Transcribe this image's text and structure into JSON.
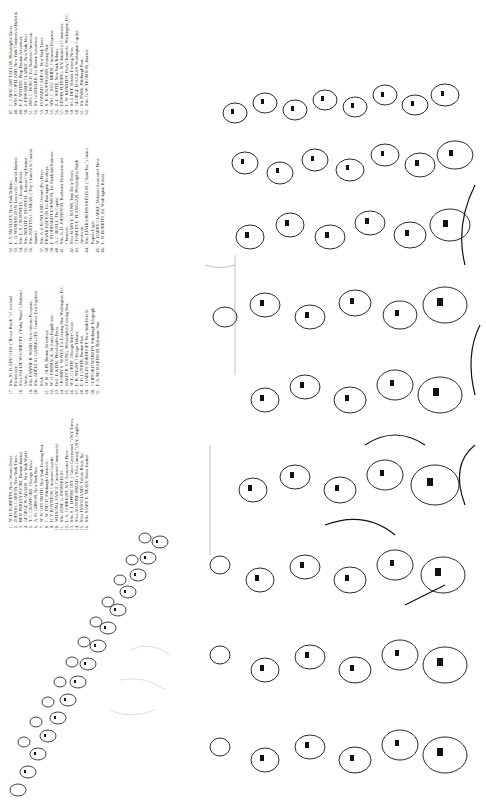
{
  "page": {
    "orientation": "rotated-90-ccw"
  },
  "key": {
    "bands": [
      {
        "range": "47-62",
        "entries": [
          {
            "n": "47.",
            "text": "C. CATHCART TAYLOR, Philadelphia Times."
          },
          {
            "n": "48.",
            "text": "WM. P. COPELAND, New York Commercial Bulletin."
          },
          {
            "n": "49.",
            "text": "E. F. WATERS, Prop. Boston Advertiser."
          },
          {
            "n": "50.",
            "text": "J. EDWARDS CLARKE, New York Mail."
          },
          {
            "n": "51.",
            "text": "JNO. C. BURCH, Ed. Nashville American."
          },
          {
            "n": "52.",
            "text": "Mr. GODDARD, Ed. Boston Advertiser."
          },
          {
            "n": "53.",
            "text": "HOWARD CARROL, New York Times."
          },
          {
            "n": "54.",
            "text": "S. H. KAUFFMANN, Evening Star."
          },
          {
            "n": "55.",
            "text": "WM. C. MAC BRIDE, Cincinnati Enquirer."
          },
          {
            "n": "56.",
            "text": "Z. L. WHITE, New York Tribune."
          },
          {
            "n": "57.",
            "text": "EDWIN FLEMING, N.Y. Journal of Commerce."
          },
          {
            "n": "58.",
            "text": "L. W. KENNEDY, Daily Chronicle, Washington, D.C."
          },
          {
            "n": "59.",
            "text": "M. J. DEE, Detroit Evening News."
          },
          {
            "n": "60.",
            "text": "GEORGE DOUGLAS, Washington Capital."
          },
          {
            "n": "61.",
            "text": "Mr. PARK, Pittsburgh Post."
          },
          {
            "n": "62.",
            "text": "Mrs. G. W. THOMSON, Journal."
          }
        ]
      },
      {
        "range": "32-46",
        "entries": [
          {
            "n": "32.",
            "text": "E. V. SMALLEY, New York Tribune."
          },
          {
            "n": "33.",
            "text": "L. Q. WASHINGTON, Louisville Courier Journal."
          },
          {
            "n": "34.",
            "text": "Mrs. E. S. CROMWELL, Chicago Herald."
          },
          {
            "n": "35.",
            "text": "Mrs. NELLIE S. STOWELL, Kansas City Journal."
          },
          {
            "n": "36.",
            "text": "Mrs. JAYETTA C. SNEAD, (\"Fay\") Louisville Courier Journal."
          },
          {
            "n": "37.",
            "text": "Mrs. A. J. ROWLAND, Oxford (Pa.) Press."
          },
          {
            "n": "38.",
            "text": "FRANK HATTON, Ed. Burlington Hawkeye."
          },
          {
            "n": "39.",
            "text": "E. STODDARDT JOHNSON, Ed. Frankfort Yeoman."
          },
          {
            "n": "40.",
            "text": "A. C. BUELL, The Capital."
          },
          {
            "n": "41.",
            "text": "Mrs. A. D. JOHNSTON, Rochester Democrat and Chronicle."
          },
          {
            "n": "42.",
            "text": "Miss MARY E. MANN, Troy Daily Times."
          },
          {
            "n": "43.",
            "text": "CHARLES L. FLANAGAN, Philadelphia North American."
          },
          {
            "n": "44.",
            "text": "Mrs. ELVIRA BLISS SHELDON, (\"Aunt Tue,\") Grand Rapids Eagle."
          },
          {
            "n": "45.",
            "text": "W. HARRY CLARKE, National Associated Press."
          },
          {
            "n": "46.",
            "text": "L. N. BURRITT, Ed. Washington Herald."
          }
        ]
      },
      {
        "range": "17-31",
        "entries": [
          {
            "n": "17.",
            "text": "Mrs. M. D. LINCOLN, (\"Bessie Beech,\") Cleveland Plaindealer."
          },
          {
            "n": "18.",
            "text": "Miss SALLIE WOODBURY, (\"Ruby Wood,\") National Union."
          },
          {
            "n": "19.",
            "text": "Mrs. FANNIE B. WARD, New Orleans Picayune."
          },
          {
            "n": "20.",
            "text": "Mrs. ADÈLE M. GARRIGUES, Courier, East Saginaw, Mich."
          },
          {
            "n": "21.",
            "text": "W. M. OLIN, Boston Advertiser."
          },
          {
            "n": "22.",
            "text": "W. O. FISHBACK, St. Louis Republican."
          },
          {
            "n": "23.",
            "text": "Dell. E. KEIM, Philadelphia Press."
          },
          {
            "n": "24.",
            "text": "CROSBY S. NOYES, Ed. Evening Star, Washington, D.C."
          },
          {
            "n": "25.",
            "text": "JAMES R. YOUNG, Philadelphia Evening Star."
          },
          {
            "n": "26.",
            "text": "W. E. CURTIS, Chicago Inter-Ocean."
          },
          {
            "n": "27.",
            "text": "E. B. WIGHT, Chicago Tribune."
          },
          {
            "n": "28.",
            "text": "E. H. LUTHER, Boston Post."
          },
          {
            "n": "29.",
            "text": "CHARLES NORDHOFF, New York Herald."
          },
          {
            "n": "30.",
            "text": "CLIFFORD WARDEN, Pittsburgh Telegraph."
          },
          {
            "n": "31.",
            "text": "F. A. RICHARDSON, Baltimore Sun."
          }
        ]
      },
      {
        "range": "1-16",
        "entries": [
          {
            "n": "1.",
            "text": "W. H. ROBERTS, New Orleans Times."
          },
          {
            "n": "2.",
            "text": "JOHN M. CARSON, New York Times."
          },
          {
            "n": "3.",
            "text": "BEN. PERLEY POORE, Boston Journal."
          },
          {
            "n": "4.",
            "text": "GEORGE W. ADAMS, New York World."
          },
          {
            "n": "5.",
            "text": "T. C. CRAWFORD, Chicago Times."
          },
          {
            "n": "6.",
            "text": "A. M. GIBSON, New York Sun."
          },
          {
            "n": "7.",
            "text": "W. SCOTT SMITH, New York Evening Post."
          },
          {
            "n": "8.",
            "text": "C. W. FITCH, Pittsburgh Chronicle."
          },
          {
            "n": "9.",
            "text": "H. V. BOYNTON, Cincinnati Gazette."
          },
          {
            "n": "10.",
            "text": "WILSON J. VANCE, Cincinnati Commercial."
          },
          {
            "n": "11.",
            "text": "Mrs. JANE G. SWISSHELM."
          },
          {
            "n": "12.",
            "text": "L. A. GOBRIGHT, N.Y. Associated Press."
          },
          {
            "n": "13.",
            "text": "Mrs. S. J. LIPPINCOTT, (\"Grace Greenwood,\") N.Y. Times."
          },
          {
            "n": "14.",
            "text": "Miss AUSTINE SNEAD, (\"Miss Grundy,\") N.Y. Graphic."
          },
          {
            "n": "15.",
            "text": "Miss EMMA JANES, Toledo Blade, &c."
          },
          {
            "n": "16.",
            "text": "Mrs. MARY E. NEALY, Home Journal."
          }
        ]
      }
    ]
  },
  "illustration": {
    "subject": "engraved crowd of press correspondents' portraits with numbered faces",
    "visible_labels": [
      "77",
      "75",
      "71",
      "70",
      "45",
      "37",
      "38",
      "32",
      "93",
      "94"
    ],
    "ink_color": "#111111",
    "paper_color": "#ffffff"
  }
}
